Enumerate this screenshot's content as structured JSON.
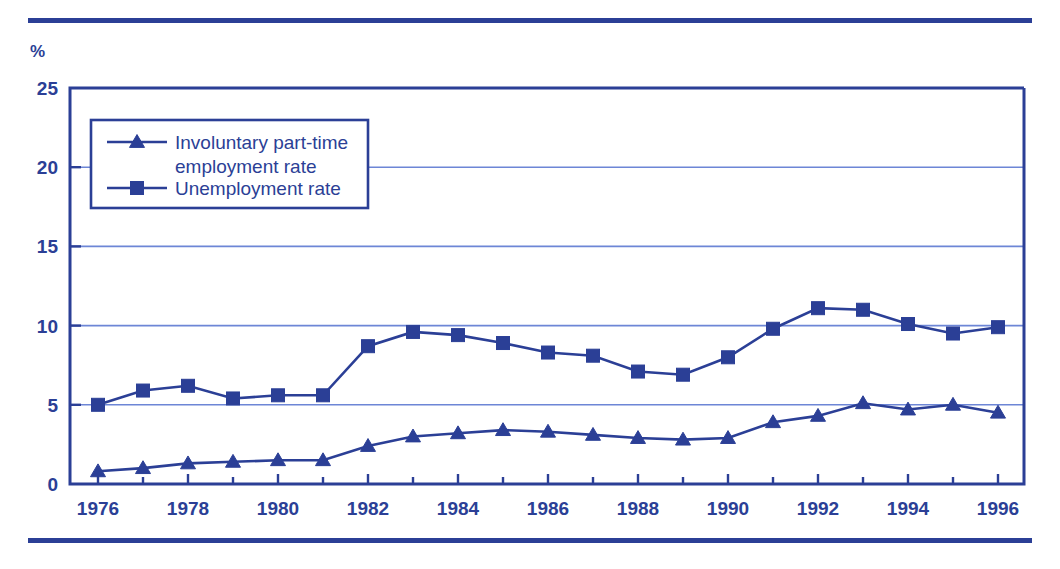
{
  "figure": {
    "y_axis_unit_label": "%",
    "top_rule": "horizontal-rule",
    "bottom_rule": "horizontal-rule"
  },
  "legend": {
    "position": "inside-top-left",
    "entries": [
      {
        "label": "Involuntary part-time",
        "label2": "employment rate",
        "marker": "triangle-marker",
        "color": "#2b3f96"
      },
      {
        "label": "Unemployment rate",
        "label2": "",
        "marker": "square-marker",
        "color": "#2b3f96"
      }
    ]
  },
  "chart_data": {
    "type": "line",
    "title": "",
    "subtitle": "",
    "xlabel": "",
    "ylabel": "%",
    "ylim": [
      0,
      25
    ],
    "xlim": [
      1976,
      1996
    ],
    "yticks": [
      0,
      5,
      10,
      15,
      20,
      25
    ],
    "ytick_labels": [
      "0",
      "5",
      "10",
      "15",
      "20",
      "25"
    ],
    "xticks": [
      1976,
      1978,
      1980,
      1982,
      1984,
      1986,
      1988,
      1990,
      1992,
      1994,
      1996
    ],
    "xtick_labels": [
      "1976",
      "1978",
      "1980",
      "1982",
      "1984",
      "1986",
      "1988",
      "1990",
      "1992",
      "1994",
      "1996"
    ],
    "x_minor_ticks": [
      1977,
      1979,
      1981,
      1983,
      1985,
      1987,
      1989,
      1991,
      1993,
      1995
    ],
    "grid": "horizontal",
    "legend_position": "upper-left-inside",
    "x": [
      1976,
      1977,
      1978,
      1979,
      1980,
      1981,
      1982,
      1983,
      1984,
      1985,
      1986,
      1987,
      1988,
      1989,
      1990,
      1991,
      1992,
      1993,
      1994,
      1995,
      1996
    ],
    "series": [
      {
        "name": "Involuntary part-time employment rate",
        "marker": "triangle",
        "color": "#2b3f96",
        "values": [
          0.8,
          1.0,
          1.3,
          1.4,
          1.5,
          1.5,
          2.4,
          3.0,
          3.2,
          3.4,
          3.3,
          3.1,
          2.9,
          2.8,
          2.9,
          3.9,
          4.3,
          5.1,
          4.7,
          5.0,
          4.5
        ]
      },
      {
        "name": "Unemployment rate",
        "marker": "square",
        "color": "#2b3f96",
        "values": [
          5.0,
          5.9,
          6.2,
          5.4,
          5.6,
          5.6,
          8.7,
          9.6,
          9.4,
          8.9,
          8.3,
          8.1,
          7.1,
          6.9,
          8.0,
          9.8,
          11.1,
          11.0,
          10.1,
          9.5,
          9.9
        ]
      }
    ]
  },
  "colors": {
    "accent": "#2b3f96",
    "gridline": "#6d86d6",
    "background": "#ffffff"
  }
}
